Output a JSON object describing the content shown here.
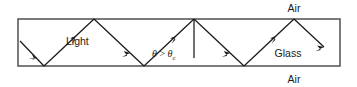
{
  "figure": {
    "labels": {
      "air_top": "Air",
      "air_bottom": "Air",
      "glass": "Glass",
      "light": "Light",
      "angle_symbol": "θ",
      "angle_operator": ">",
      "angle_critical_symbol": "θ",
      "angle_critical_subscript": "c"
    },
    "colors": {
      "background": "#ffffff",
      "slab_border": "#5a5a5a",
      "ray": "#1a1a1a",
      "text": "#1a1a1a"
    },
    "slab": {
      "x": 18,
      "y": 19,
      "width": 322,
      "height": 47
    },
    "geometry": {
      "top_y": 19,
      "bottom_y": 66,
      "entry_point": [
        20,
        41
      ],
      "bounce_points": [
        [
          44,
          66
        ],
        [
          94,
          19
        ],
        [
          144,
          66
        ],
        [
          194,
          19
        ],
        [
          244,
          66
        ],
        [
          294,
          19
        ],
        [
          322,
          47
        ]
      ],
      "normal_line": [
        194,
        19,
        194,
        58
      ]
    },
    "label_positions": {
      "air_top": [
        294,
        9
      ],
      "air_bottom": [
        294,
        80
      ],
      "glass": [
        288,
        54
      ],
      "light": [
        66,
        42
      ],
      "angle": [
        152,
        55
      ]
    }
  }
}
